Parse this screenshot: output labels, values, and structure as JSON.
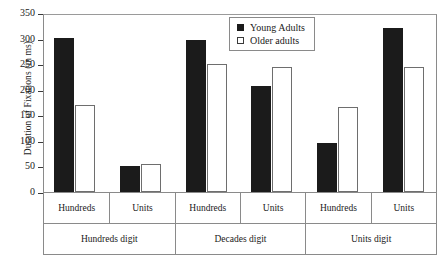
{
  "chart_data": {
    "type": "bar",
    "title": "",
    "xlabel": "",
    "ylabel": "Duration of Fixations (in ms)",
    "ylim": [
      0,
      350
    ],
    "yticks": [
      0,
      50,
      100,
      150,
      200,
      250,
      300,
      350
    ],
    "grid": false,
    "legend_position": "top-right",
    "categories": [
      "Hundreds",
      "Units",
      "Hundreds",
      "Units",
      "Hundreds",
      "Units"
    ],
    "group_labels": [
      "Hundreds digit",
      "Decades digit",
      "Units digit"
    ],
    "series": [
      {
        "name": "Young Adults",
        "color": "#1b1b1b",
        "fill": "solid",
        "values": [
          302,
          50,
          297,
          207,
          95,
          320
        ]
      },
      {
        "name": "Older adults",
        "color": "#ffffff",
        "fill": "open",
        "values": [
          170,
          54,
          250,
          245,
          167,
          245
        ]
      }
    ]
  },
  "axis": {
    "y_title": "Duration of Fixations (in ms)",
    "y_tick_labels": [
      "350",
      "300",
      "250",
      "200",
      "150",
      "100",
      "50",
      "0"
    ]
  },
  "legend": {
    "items": [
      {
        "label": "Young Adults",
        "swatch": "filled-square-icon"
      },
      {
        "label": "Older adults",
        "swatch": "open-square-icon"
      }
    ]
  },
  "x_axis": {
    "level1": [
      "Hundreds",
      "Units",
      "Hundreds",
      "Units",
      "Hundreds",
      "Units"
    ],
    "level2": [
      "Hundreds digit",
      "Decades digit",
      "Units digit"
    ]
  }
}
